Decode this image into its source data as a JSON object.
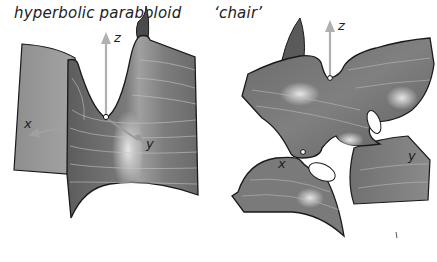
{
  "figures": [
    {
      "title": "hyperbolic paraboloid",
      "axes": {
        "z": "z",
        "x": "x",
        "y": "y"
      }
    },
    {
      "title": "‘chair’",
      "axes": {
        "z": "z",
        "x": "x",
        "y": "y"
      }
    }
  ],
  "colors": {
    "surface_dark": "#5a5a5a",
    "surface_mid": "#808080",
    "surface_light": "#a8a8a8",
    "highlight": "#e6e6e6",
    "axis_arrow": "#b0b0b0",
    "edge": "#1a1a1a"
  }
}
